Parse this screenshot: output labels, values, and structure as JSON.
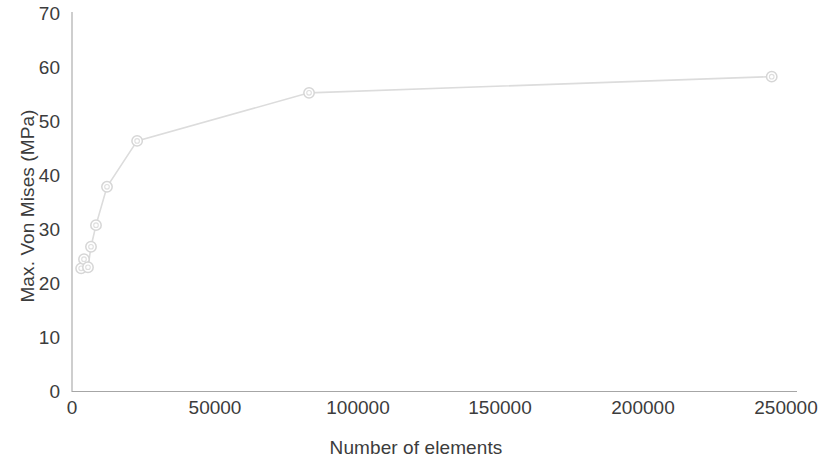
{
  "chart_data": {
    "type": "scatter",
    "title": "",
    "subtitle": "",
    "xlabel": "Number of elements",
    "ylabel": "Max. Von Mises  (MPa)",
    "xlim": [
      0,
      250000
    ],
    "ylim": [
      0,
      70
    ],
    "xticks": [
      0,
      50000,
      100000,
      150000,
      200000,
      250000
    ],
    "yticks": [
      0,
      10,
      20,
      30,
      40,
      50,
      60,
      70
    ],
    "xtick_labels": [
      "0",
      "50000",
      "100000",
      "150000",
      "200000",
      "250000"
    ],
    "ytick_labels": [
      "0",
      "10",
      "20",
      "30",
      "40",
      "50",
      "60",
      "70"
    ],
    "grid": false,
    "legend": false,
    "legend_position": "none",
    "marker": "circle-open",
    "line_color": "#dcdcdc",
    "marker_color": "#d6d6d6",
    "axis_color": "#a6a6a6",
    "background_color": "#ffffff",
    "series": [
      {
        "name": "Max. Von Mises",
        "x": [
          3200,
          4200,
          5600,
          6650,
          8400,
          12250,
          22800,
          83000,
          245000
        ],
        "y": [
          22.9,
          24.6,
          23.1,
          26.9,
          30.9,
          38.0,
          46.5,
          55.4,
          58.4
        ]
      }
    ]
  },
  "axes": {
    "y_title": "Max. Von Mises  (MPa)",
    "x_title": "Number of elements"
  }
}
